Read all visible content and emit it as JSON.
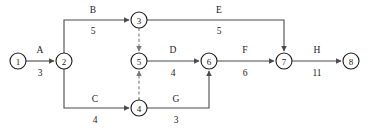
{
  "diagram": {
    "type": "activity-on-arrow-network",
    "title": "",
    "width": 372,
    "height": 132,
    "colors": {
      "background": "#ffffff",
      "node_stroke": "#1a1a1a",
      "node_fill": "#ffffff",
      "edge_solid": "#4a4a4a",
      "edge_dashed": "#777777",
      "text": "#1a1a1a"
    },
    "nodes": [
      {
        "id": "n1",
        "label": "1",
        "cx": 18,
        "cy": 61,
        "r": 8
      },
      {
        "id": "n2",
        "label": "2",
        "cx": 64,
        "cy": 61,
        "r": 8
      },
      {
        "id": "n3",
        "label": "3",
        "cx": 139,
        "cy": 20,
        "r": 8
      },
      {
        "id": "n4",
        "label": "4",
        "cx": 139,
        "cy": 108,
        "r": 8
      },
      {
        "id": "n5",
        "label": "5",
        "cx": 139,
        "cy": 61,
        "r": 8
      },
      {
        "id": "n6",
        "label": "6",
        "cx": 209,
        "cy": 61,
        "r": 8
      },
      {
        "id": "n7",
        "label": "7",
        "cx": 284,
        "cy": 61,
        "r": 8
      },
      {
        "id": "n8",
        "label": "8",
        "cx": 351,
        "cy": 61,
        "r": 8
      }
    ],
    "edges": [
      {
        "id": "eA",
        "name": "A",
        "duration": "3",
        "from": "n1",
        "to": "n2",
        "style": "solid",
        "path": "M 26 61 L 54 61",
        "label_x": 40,
        "label_y": 50,
        "dur_x": 40,
        "dur_y": 73
      },
      {
        "id": "eB",
        "name": "B",
        "duration": "5",
        "from": "n2",
        "to": "n3",
        "style": "solid",
        "path": "M 64 53 L 64 20 L 129 20",
        "label_x": 93,
        "label_y": 10,
        "dur_x": 93,
        "dur_y": 31
      },
      {
        "id": "eC",
        "name": "C",
        "duration": "4",
        "from": "n2",
        "to": "n4",
        "style": "solid",
        "path": "M 64 69 L 64 108 L 129 108",
        "label_x": 95,
        "label_y": 99,
        "dur_x": 95,
        "dur_y": 120
      },
      {
        "id": "eD",
        "name": "D",
        "duration": "4",
        "from": "n5",
        "to": "n6",
        "style": "solid",
        "path": "M 147 61 L 199 61",
        "label_x": 173,
        "label_y": 50,
        "dur_x": 173,
        "dur_y": 73
      },
      {
        "id": "eE",
        "name": "E",
        "duration": "5",
        "from": "n3",
        "to": "n7",
        "style": "solid",
        "path": "M 147 20 L 284 20 L 284 51",
        "label_x": 219,
        "label_y": 10,
        "dur_x": 219,
        "dur_y": 31
      },
      {
        "id": "eF",
        "name": "F",
        "duration": "6",
        "from": "n6",
        "to": "n7",
        "style": "solid",
        "path": "M 217 61 L 274 61",
        "label_x": 245,
        "label_y": 50,
        "dur_x": 245,
        "dur_y": 73
      },
      {
        "id": "eG",
        "name": "G",
        "duration": "3",
        "from": "n4",
        "to": "n6",
        "style": "solid",
        "path": "M 147 108 L 209 108 L 209 71",
        "label_x": 176,
        "label_y": 99,
        "dur_x": 176,
        "dur_y": 120
      },
      {
        "id": "eH",
        "name": "H",
        "duration": "11",
        "from": "n7",
        "to": "n8",
        "style": "solid",
        "path": "M 292 61 L 341 61",
        "label_x": 317,
        "label_y": 50,
        "dur_x": 317,
        "dur_y": 73
      },
      {
        "id": "eDummy1",
        "name": "",
        "duration": "",
        "from": "n3",
        "to": "n5",
        "style": "dashed",
        "path": "M 139 28 L 139 51",
        "label_x": 0,
        "label_y": 0,
        "dur_x": 0,
        "dur_y": 0
      },
      {
        "id": "eDummy2",
        "name": "",
        "duration": "",
        "from": "n4",
        "to": "n5",
        "style": "dashed",
        "path": "M 139 100 L 139 71",
        "label_x": 0,
        "label_y": 0,
        "dur_x": 0,
        "dur_y": 0
      }
    ]
  }
}
